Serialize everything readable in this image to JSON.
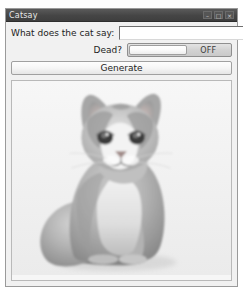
{
  "window": {
    "title": "Catsay",
    "controls": [
      {
        "name": "minimize",
        "glyph": "–"
      },
      {
        "name": "maximize",
        "glyph": "□"
      },
      {
        "name": "close",
        "glyph": "×"
      }
    ]
  },
  "form": {
    "cat_say": {
      "label": "What does the cat say:",
      "value": "",
      "placeholder": ""
    },
    "dead": {
      "label": "Dead?",
      "state_text": "OFF",
      "checked": false
    },
    "generate_label": "Generate"
  },
  "image": {
    "alt": "Photograph of a grey and white cat sitting upright, facing the camera",
    "subject": "cat",
    "rendering": "grayscale-photo"
  },
  "colors": {
    "titlebar": "#454545",
    "titlebar_text": "#e8e8e8",
    "window_face": "#f1f1f1",
    "window_border": "#9a9a9a",
    "text": "#1d1d1d",
    "input_background": "#ffffff",
    "toggle_track": "#d2d2d2",
    "toggle_thumb": "#ffffff",
    "image_pane_background": "#f6f6f6",
    "desktop": "#ffffff"
  }
}
